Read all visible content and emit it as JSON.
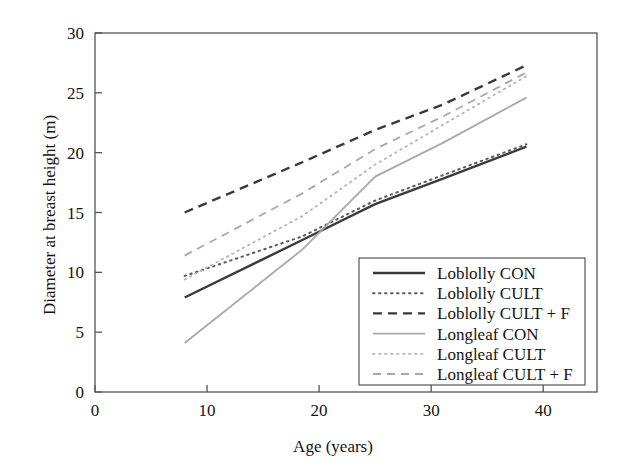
{
  "chart_data": {
    "type": "line",
    "title": "",
    "xlabel": "Age (years)",
    "ylabel": "Diameter at breast height (m)",
    "xlim": [
      0,
      44.8
    ],
    "ylim": [
      0,
      30
    ],
    "xticks": [
      0,
      10,
      20,
      30,
      40
    ],
    "yticks": [
      0,
      5,
      10,
      15,
      20,
      25,
      30
    ],
    "xtick_labels": [
      "0",
      "10",
      "20",
      "30",
      "40"
    ],
    "ytick_labels": [
      "0",
      "5",
      "10",
      "15",
      "20",
      "25",
      "30"
    ],
    "grid": false,
    "legend_position": "lower right",
    "series": [
      {
        "name": "Loblolly CON",
        "style": "solid",
        "color": "#3a3a3a",
        "width": 2.4,
        "x": [
          8,
          18.5,
          25,
          31,
          38.5
        ],
        "y": [
          7.9,
          12.7,
          15.7,
          17.8,
          20.5
        ]
      },
      {
        "name": "Loblolly CULT",
        "style": "dotted",
        "color": "#5a5a5a",
        "width": 2.0,
        "x": [
          8,
          18.5,
          25,
          31,
          38.5
        ],
        "y": [
          9.7,
          13.0,
          16.0,
          18.1,
          20.7
        ]
      },
      {
        "name": "Loblolly CULT + F",
        "style": "dashed",
        "color": "#3a3a3a",
        "width": 2.4,
        "x": [
          8,
          18.5,
          25,
          31,
          38.5
        ],
        "y": [
          15.0,
          19.2,
          21.9,
          24.0,
          27.3
        ]
      },
      {
        "name": "Longleaf CON",
        "style": "solid",
        "color": "#a8a8a8",
        "width": 1.8,
        "x": [
          8,
          18.5,
          25,
          31,
          38.5
        ],
        "y": [
          4.1,
          11.9,
          18.0,
          20.8,
          24.6
        ]
      },
      {
        "name": "Longleaf CULT",
        "style": "dotted",
        "color": "#b5b5b5",
        "width": 1.8,
        "x": [
          8,
          18.5,
          25,
          31,
          38.5
        ],
        "y": [
          9.4,
          14.7,
          19.0,
          22.3,
          26.4
        ]
      },
      {
        "name": "Longleaf CULT + F",
        "style": "dashed",
        "color": "#a8a8a8",
        "width": 1.8,
        "x": [
          8,
          18.5,
          25,
          31,
          38.5
        ],
        "y": [
          11.4,
          16.6,
          20.3,
          23.0,
          26.7
        ]
      }
    ]
  },
  "legend": {
    "entries": [
      {
        "label": "Loblolly CON"
      },
      {
        "label": "Loblolly CULT"
      },
      {
        "label": "Loblolly CULT + F"
      },
      {
        "label": "Longleaf CON"
      },
      {
        "label": "Longleaf CULT"
      },
      {
        "label": "Longleaf CULT + F"
      }
    ]
  }
}
